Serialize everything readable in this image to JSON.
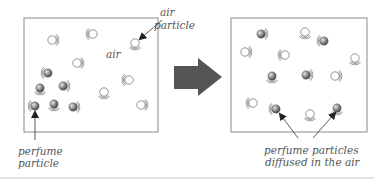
{
  "diagram": {
    "colors": {
      "box_border": "#8a8a8a",
      "arrow_fill": "#555555",
      "perfume_particle": "#7d7d7d",
      "air_particle_stroke": "#8a8a8a",
      "label_text": "#555555",
      "divider": "#c8c8c8"
    },
    "before": {
      "box": {
        "x": 24,
        "y": 18,
        "w": 134,
        "h": 114
      },
      "labels": {
        "air_region": "air",
        "air_particle_line1": "air",
        "air_particle_line2": "particle",
        "perfume_particle_line1": "perfume",
        "perfume_particle_line2": "particle"
      },
      "perfume_particles": [
        [
          48,
          73
        ],
        [
          40,
          88
        ],
        [
          63,
          86
        ],
        [
          35,
          106
        ],
        [
          54,
          104
        ],
        [
          73,
          107
        ]
      ],
      "air_particles": [
        [
          52,
          40
        ],
        [
          93,
          34
        ],
        [
          135,
          43
        ],
        [
          77,
          63
        ],
        [
          129,
          80
        ],
        [
          104,
          92
        ],
        [
          141,
          105
        ]
      ]
    },
    "transition_arrow": {
      "direction": "right"
    },
    "after": {
      "box": {
        "x": 231,
        "y": 18,
        "w": 136,
        "h": 114
      },
      "labels": {
        "caption_line1": "perfume particles",
        "caption_line2": "diffused in the air"
      },
      "perfume_particles": [
        [
          261,
          34
        ],
        [
          324,
          41
        ],
        [
          272,
          76
        ],
        [
          306,
          75
        ],
        [
          276,
          109
        ],
        [
          337,
          108
        ]
      ],
      "air_particles": [
        [
          305,
          32
        ],
        [
          245,
          52
        ],
        [
          285,
          55
        ],
        [
          355,
          58
        ],
        [
          335,
          76
        ],
        [
          253,
          103
        ],
        [
          310,
          114
        ]
      ]
    }
  }
}
